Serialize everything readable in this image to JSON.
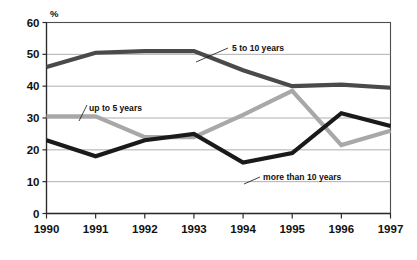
{
  "chart_data": {
    "type": "line",
    "title": "",
    "xlabel": "",
    "ylabel": "%",
    "unit_label": "%",
    "categories": [
      "1990",
      "1991",
      "1992",
      "1993",
      "1994",
      "1995",
      "1996",
      "1997"
    ],
    "x": [
      1990,
      1991,
      1992,
      1993,
      1994,
      1995,
      1996,
      1997
    ],
    "ylim": [
      0,
      60
    ],
    "yticks": [
      0,
      10,
      20,
      30,
      40,
      50,
      60
    ],
    "ytick_labels": [
      "0",
      "10",
      "20",
      "30",
      "40",
      "50",
      "60"
    ],
    "grid": true,
    "grid_axis": "y",
    "legend_position": "inline-annotations",
    "series": [
      {
        "name": "5 to 10 years",
        "label": "5 to 10 years",
        "color": "#4a4a4a",
        "stroke_width": 4.2,
        "values": [
          46,
          50.5,
          51,
          51,
          45,
          40,
          40.5,
          39.5
        ]
      },
      {
        "name": "up to 5 years",
        "label": "up to 5 years",
        "color": "#a8a8a8",
        "stroke_width": 4.2,
        "values": [
          30.5,
          30.5,
          24,
          24,
          31,
          38.5,
          21.5,
          26
        ]
      },
      {
        "name": "more than 10 years",
        "label": "more than 10 years",
        "color": "#1a1a1a",
        "stroke_width": 4.2,
        "values": [
          23,
          18,
          23,
          25,
          16,
          19,
          31.5,
          27.5
        ]
      }
    ],
    "annotations": [
      {
        "text": "5 to 10 years",
        "anchor_series": "5 to 10 years",
        "x": 232,
        "y": 51
      },
      {
        "text": "up to 5 years",
        "anchor_series": "up to 5 years",
        "x": 89,
        "y": 111
      },
      {
        "text": "more than 10 years",
        "anchor_series": "more than 10 years",
        "x": 263,
        "y": 180
      }
    ]
  },
  "colors": {
    "background": "#ffffff",
    "gridline": "#9b9b9b",
    "frame": "#4d4d4d",
    "axis": "#2b2b2b",
    "text": "#111111",
    "series_up_to_5": "#a8a8a8",
    "series_5_to_10": "#4a4a4a",
    "series_more_than_10": "#1a1a1a"
  }
}
